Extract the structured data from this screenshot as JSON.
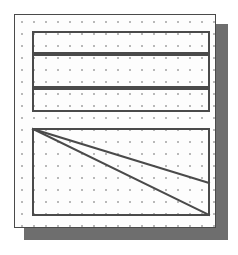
{
  "canvas": {
    "width": 238,
    "height": 255,
    "background_color": "#ffffff"
  },
  "page": {
    "label": "page-sheet",
    "x": 14,
    "y": 14,
    "width": 202,
    "height": 214,
    "fill_color": "#fdfdfd",
    "border_color": "#4a4a4a",
    "border_width": 1
  },
  "shadow": {
    "label": "drop-shadow",
    "x": 24,
    "y": 24,
    "width": 204,
    "height": 216,
    "color": "#6e6e6e"
  },
  "grid": {
    "label": "dot-grid",
    "spacing": 12,
    "dot_color": "#b9b9b9",
    "dot_radius": 1,
    "offset_x": 6,
    "offset_y": 6
  },
  "shapes": {
    "stroke_color": "#4a4a4a",
    "stroke_width": 2,
    "bands": [
      {
        "name": "band-top",
        "x": 18,
        "y": 17,
        "width": 176,
        "height": 21
      },
      {
        "name": "band-middle",
        "x": 18,
        "y": 40,
        "width": 176,
        "height": 32
      },
      {
        "name": "band-bottom",
        "x": 18,
        "y": 74,
        "width": 176,
        "height": 22
      }
    ],
    "panel": {
      "name": "panel-main",
      "x": 18,
      "y": 114,
      "width": 176,
      "height": 86
    },
    "diagonals": [
      {
        "name": "diagonal-upper",
        "x1": 18,
        "y1": 114,
        "x2": 194,
        "y2": 168
      },
      {
        "name": "diagonal-lower",
        "x1": 18,
        "y1": 114,
        "x2": 194,
        "y2": 200
      }
    ]
  }
}
